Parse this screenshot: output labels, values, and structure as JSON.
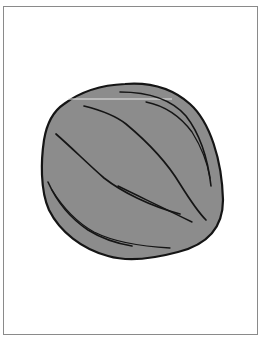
{
  "image": {
    "subject": "nut-shell-illustration",
    "label": "Stylized nut shell with curved ridge lines"
  },
  "frame": {
    "border_color": "#8a8a8a",
    "background": "#ffffff"
  },
  "nut": {
    "fill_color": "#8c8c8c",
    "outline_color": "#151515",
    "highlight_color": "#e6e6e6"
  }
}
